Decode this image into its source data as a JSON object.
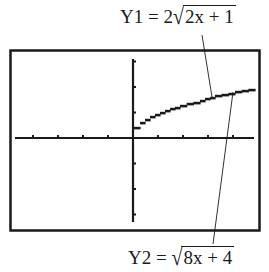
{
  "labels": {
    "y1": {
      "name": "Y1",
      "equals": "=",
      "coef": "2",
      "radicand": "2x + 1"
    },
    "y2": {
      "name": "Y2",
      "equals": "=",
      "coef": "",
      "radicand": "8x + 4"
    }
  },
  "colors": {
    "ink": "#1a1a1a",
    "background": "#ffffff"
  },
  "chart_data": {
    "type": "line",
    "title": "",
    "xlabel": "",
    "ylabel": "",
    "grid": false,
    "legend": "leader-line labels (top: Y1 = 2√(2x+1), bottom: Y2 = √(8x+4))",
    "x_ticks_each_side": 4,
    "y_ticks_each_side": 3,
    "units": "tick marks",
    "xlim": [
      -4.9,
      5.1
    ],
    "ylim": [
      -3.4,
      3.45
    ],
    "series": [
      {
        "name": "Y1 = 2√(2x + 1) and Y2 = √(8x + 4) (identical graphs)",
        "x": [
          0.04,
          0.28,
          0.68,
          1.28,
          1.88,
          2.68,
          3.28,
          4.08,
          4.88
        ],
        "y": [
          0.24,
          0.55,
          0.78,
          1.02,
          1.22,
          1.41,
          1.61,
          1.76,
          1.92
        ]
      }
    ]
  }
}
